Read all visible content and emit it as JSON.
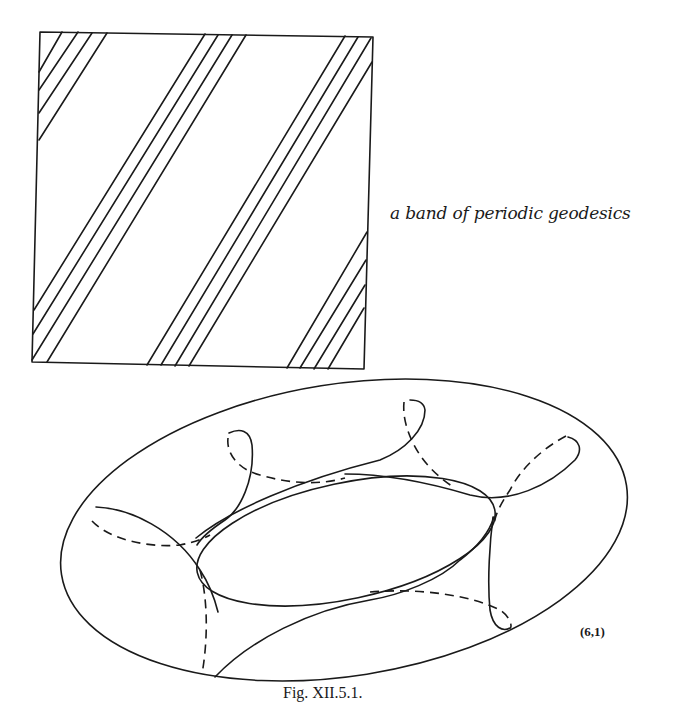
{
  "figure": {
    "band_label": "a band of periodic geodesics",
    "torus_knot_label": "(6,1)",
    "caption": "Fig. XII.5.1."
  },
  "square": {
    "corners": [
      [
        40,
        32
      ],
      [
        373,
        37
      ],
      [
        364,
        369
      ],
      [
        32,
        362
      ]
    ],
    "band_groups": [
      {
        "name": "top-left-band",
        "line_count": 4
      },
      {
        "name": "middle-band-1",
        "line_count": 4
      },
      {
        "name": "middle-band-2",
        "line_count": 4
      },
      {
        "name": "bottom-right-band",
        "line_count": 4
      }
    ]
  },
  "torus": {
    "outer_outline": "ellipse",
    "inner_hole": "ellipse",
    "curve_style": {
      "solid": "front",
      "dashed": "back"
    },
    "knot": "(6,1)"
  },
  "colors": {
    "ink": "#1a1a1a",
    "paper": "#ffffff"
  }
}
